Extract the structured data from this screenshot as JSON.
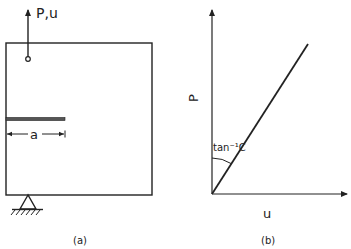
{
  "figure_a": {
    "load_label": "P,u",
    "crack_length_label": "a",
    "caption": "(a)"
  },
  "figure_b": {
    "y_axis_label": "P",
    "x_axis_label": "u",
    "angle_label": "tan⁻¹C",
    "caption": "(b)"
  },
  "colors": {
    "ink": "#222222",
    "background": "#ffffff"
  }
}
